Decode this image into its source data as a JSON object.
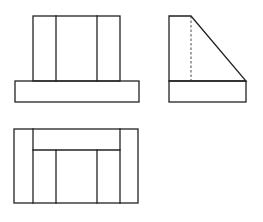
{
  "diagram": {
    "type": "orthographic-three-view",
    "line_color": "#222222",
    "background": "#ffffff",
    "views": [
      {
        "name": "front-view",
        "position": "top-left",
        "rects": [
          {
            "name": "upper-block",
            "x": 33,
            "y": 16,
            "w": 87,
            "h": 65
          },
          {
            "name": "base-block",
            "x": 15,
            "y": 81,
            "w": 124,
            "h": 21
          }
        ],
        "lines": [
          {
            "name": "inner-left-edge",
            "x1": 56,
            "y1": 16,
            "x2": 56,
            "y2": 81,
            "style": "solid"
          },
          {
            "name": "inner-right-edge",
            "x1": 97,
            "y1": 16,
            "x2": 97,
            "y2": 81,
            "style": "solid"
          }
        ]
      },
      {
        "name": "side-view",
        "position": "top-right",
        "polygons": [
          {
            "name": "sloped-block",
            "points": "169,16 191,16 246,81 169,81"
          }
        ],
        "rects": [
          {
            "name": "base-block",
            "x": 169,
            "y": 81,
            "w": 77,
            "h": 21
          }
        ],
        "lines": [
          {
            "name": "hidden-edge",
            "x1": 191,
            "y1": 16,
            "x2": 191,
            "y2": 81,
            "style": "dashed"
          }
        ]
      },
      {
        "name": "top-view",
        "position": "bottom-left",
        "rects": [
          {
            "name": "outline",
            "x": 14,
            "y": 129,
            "w": 124,
            "h": 74
          }
        ],
        "lines": [
          {
            "name": "left-strip-edge",
            "x1": 33,
            "y1": 129,
            "x2": 33,
            "y2": 203,
            "style": "solid"
          },
          {
            "name": "right-strip-edge",
            "x1": 120,
            "y1": 129,
            "x2": 120,
            "y2": 203,
            "style": "solid"
          },
          {
            "name": "slope-top-edge",
            "x1": 33,
            "y1": 150,
            "x2": 120,
            "y2": 150,
            "style": "solid"
          },
          {
            "name": "inner-left-edge",
            "x1": 56,
            "y1": 150,
            "x2": 56,
            "y2": 203,
            "style": "solid"
          },
          {
            "name": "inner-right-edge",
            "x1": 97,
            "y1": 150,
            "x2": 97,
            "y2": 203,
            "style": "solid"
          }
        ]
      }
    ]
  }
}
